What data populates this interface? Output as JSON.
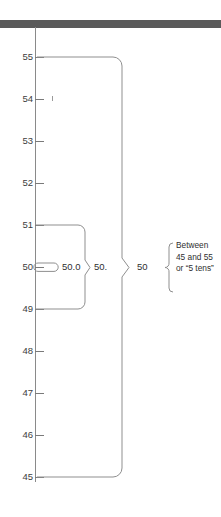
{
  "diagram": {
    "title_bar": {
      "color": "#5a5a5a"
    },
    "axis": {
      "name": "vertical-measurement-scale",
      "min": 45,
      "max": 55,
      "tick_labels": [
        "55",
        "54",
        "53",
        "52",
        "51",
        "50",
        "49",
        "48",
        "47",
        "46",
        "45"
      ],
      "tick_values": [
        55,
        54,
        53,
        52,
        51,
        50,
        49,
        48,
        47,
        46,
        45
      ],
      "line_color": "#8a8a8a"
    },
    "inner_capsule": {
      "name": "precision-capsule-50-0",
      "label": "50.0",
      "from": 50.05,
      "to": 49.95
    },
    "brace_small": {
      "name": "brace-50-point",
      "label": "50.",
      "from": 51,
      "to": 49
    },
    "brace_large": {
      "name": "brace-50",
      "label": "50",
      "from": 55,
      "to": 45
    },
    "note": {
      "name": "range-explanation",
      "lines": [
        "Between",
        "45 and 55",
        "or “5 tens”"
      ]
    }
  }
}
